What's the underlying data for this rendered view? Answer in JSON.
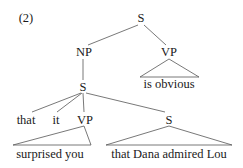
{
  "example_number": "(2)",
  "tree": {
    "root": {
      "label": "S"
    },
    "np": {
      "label": "NP"
    },
    "vp_top": {
      "label": "VP",
      "yield": "is obvious"
    },
    "s_embedded": {
      "label": "S"
    },
    "complementizer": {
      "label": "that"
    },
    "pronoun": {
      "label": "it"
    },
    "vp_inner": {
      "label": "VP",
      "yield": "surprised you"
    },
    "s_clause": {
      "label": "S",
      "yield": "that Dana admired Lou"
    }
  },
  "colors": {
    "line": "#555555",
    "text": "#1a1a1a",
    "background": "#ffffff"
  }
}
